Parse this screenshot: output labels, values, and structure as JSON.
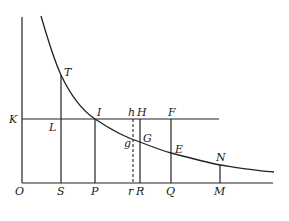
{
  "diagram": {
    "labels": {
      "T": "T",
      "K": "K",
      "L": "L",
      "I": "I",
      "h": "h",
      "H": "H",
      "F": "F",
      "g": "g",
      "G": "G",
      "E": "E",
      "N": "N",
      "O": "O",
      "S": "S",
      "P": "P",
      "r": "r",
      "R": "R",
      "Q": "Q",
      "M": "M"
    },
    "colors": {
      "line": "#222222",
      "background": "#ffffff"
    }
  }
}
